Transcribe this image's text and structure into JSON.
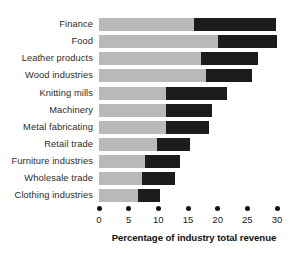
{
  "chart_data": {
    "type": "bar",
    "orientation": "horizontal",
    "stacked": true,
    "title": "",
    "xlabel": "Percentage of industry total revenue",
    "ylabel": "",
    "xlim": [
      0,
      30
    ],
    "xticks": [
      0,
      5,
      10,
      15,
      20,
      25,
      30
    ],
    "xtick_labels": [
      "0",
      "5",
      "10",
      "15",
      "20",
      "25",
      "30"
    ],
    "grid": false,
    "legend": null,
    "categories": [
      "Finance",
      "Food",
      "Leather products",
      "Wood industries",
      "Knitting mills",
      "Machinery",
      "Metal fabricating",
      "Retail trade",
      "Furniture industries",
      "Wholesale trade",
      "Clothing industries"
    ],
    "series": [
      {
        "name": "light-segment",
        "color": "#b9b9b9",
        "values": [
          16.0,
          20.0,
          17.2,
          18.0,
          11.3,
          11.3,
          11.3,
          9.8,
          7.8,
          7.3,
          6.6
        ]
      },
      {
        "name": "dark-segment",
        "color": "#1c1c1c",
        "values": [
          13.8,
          10.0,
          9.6,
          7.8,
          10.3,
          7.7,
          7.2,
          5.5,
          5.9,
          5.5,
          3.7
        ]
      }
    ],
    "totals": [
      29.8,
      30.0,
      26.8,
      25.8,
      21.6,
      19.0,
      18.5,
      15.3,
      13.7,
      12.8,
      10.3
    ]
  },
  "colors": {
    "light_segment": "#b9b9b9",
    "dark_segment": "#1c1c1c",
    "background": "#ffffff",
    "text": "#1a1a1a",
    "tick_dot": "#111111"
  }
}
